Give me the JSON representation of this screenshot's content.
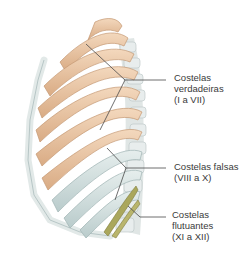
{
  "figure": {
    "colors": {
      "true_ribs": "#e9c3a0",
      "true_ribs_shadow": "#caa07c",
      "false_ribs": "#d4e0df",
      "false_ribs_shadow": "#a9bcbc",
      "floating_ribs": "#a9a55a",
      "cartilage": "#e6eceb",
      "vertebrae": "#dde3e2",
      "leader_line": "#4a4a4a",
      "label_text": "#3a3a3a"
    }
  },
  "labels": [
    {
      "id": "true-ribs",
      "lines": [
        "Costelas",
        "verdadeiras",
        "(I a VII)"
      ]
    },
    {
      "id": "false-ribs",
      "lines": [
        "Costelas falsas",
        "(VIII a X)"
      ]
    },
    {
      "id": "floating-ribs",
      "lines": [
        "Costelas",
        "flutuantes",
        "(XI a XII)"
      ]
    }
  ]
}
